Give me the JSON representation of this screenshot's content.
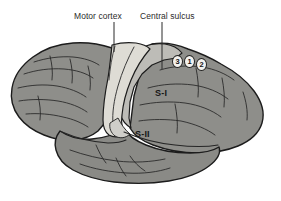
{
  "figure": {
    "background_color": "#ffffff"
  },
  "callouts": [
    {
      "id": "motor-cortex",
      "label": "Motor cortex",
      "leader_line": {
        "x": 114,
        "y_top": 22,
        "y_bottom": 52
      }
    },
    {
      "id": "central-sulcus",
      "label": "Central sulcus",
      "leader_line": {
        "x": 162,
        "y_top": 22,
        "y_bottom": 69
      }
    }
  ],
  "regions": [
    {
      "id": "s1",
      "label": "S-I",
      "description": "Primary somatosensory cortex",
      "fill_color": "#bdbcb7"
    },
    {
      "id": "s2",
      "label": "S-II",
      "description": "Secondary somatosensory cortex",
      "fill_color": "#8e8e8a"
    },
    {
      "id": "motor-strip",
      "label": "",
      "description": "Precentral motor strip",
      "fill_color": "#dedcd5"
    },
    {
      "id": "cortex",
      "label": "",
      "description": "Cerebral cortex body",
      "fill_color": "#8e8e8a"
    }
  ],
  "area_badges": [
    {
      "id": "area-3",
      "label": "3"
    },
    {
      "id": "area-1",
      "label": "1"
    },
    {
      "id": "area-2",
      "label": "2"
    }
  ],
  "colors": {
    "cortex_fill": "#8e8e8a",
    "cortex_fill_light": "#9a9a95",
    "s1_fill": "#bdbcb7",
    "motor_strip_fill": "#dedcd5",
    "temporal_fill": "#8a8a86",
    "outline": "#1c1c1c",
    "sulci_line": "#262626",
    "label_text": "#2b2b2b",
    "badge_fill": "#f2f1ee",
    "background": "#ffffff"
  }
}
